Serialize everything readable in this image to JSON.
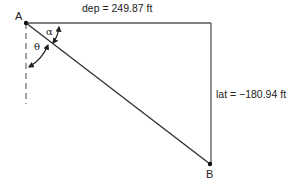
{
  "diagram": {
    "points": {
      "A": {
        "label": "A",
        "x": 26,
        "y": 23
      },
      "B": {
        "label": "B",
        "x": 210,
        "y": 164
      },
      "corner": {
        "x": 211,
        "y": 23
      }
    },
    "departure_label": "dep = 249.87 ft",
    "latitude_label": "lat = −180.94 ft",
    "angle_alpha": "α",
    "angle_theta": "θ",
    "colors": {
      "line": "#333333",
      "text": "#222222",
      "background": "#ffffff"
    }
  }
}
